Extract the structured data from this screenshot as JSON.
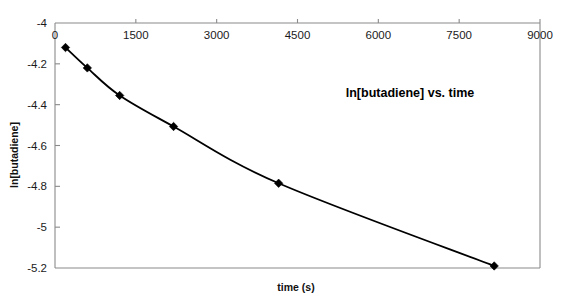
{
  "chart_data": {
    "type": "line",
    "title": "ln[butadiene] vs. time",
    "xlabel": "time (s)",
    "ylabel": "ln[butadiene]",
    "xlim": [
      0,
      9000
    ],
    "ylim": [
      -5.2,
      -4.0
    ],
    "grid": false,
    "legend": false,
    "legend_position": "none",
    "marker": "filled-diamond",
    "line_color": "#000000",
    "marker_color": "#000000",
    "frame_color": "#8a8a8a",
    "xticks": [
      0,
      1500,
      3000,
      4500,
      6000,
      7500,
      9000
    ],
    "xtick_labels": [
      "0",
      "1500",
      "3000",
      "4500",
      "6000",
      "7500",
      "9000"
    ],
    "yticks": [
      -4.0,
      -4.2,
      -4.4,
      -4.6,
      -4.8,
      -5.0,
      -5.2
    ],
    "ytick_labels": [
      "-4",
      "-4.2",
      "-4.4",
      "-4.6",
      "-4.8",
      "-5",
      "-5.2"
    ],
    "x": [
      195,
      600,
      1200,
      2200,
      4150,
      8150
    ],
    "y": [
      -4.12,
      -4.22,
      -4.355,
      -4.507,
      -4.785,
      -5.19
    ],
    "points": [
      {
        "x": 195,
        "y": -4.12
      },
      {
        "x": 600,
        "y": -4.22
      },
      {
        "x": 1200,
        "y": -4.355
      },
      {
        "x": 2200,
        "y": -4.507
      },
      {
        "x": 4150,
        "y": -4.785
      },
      {
        "x": 8150,
        "y": -5.19
      }
    ],
    "series": [
      {
        "name": "ln[butadiene]",
        "x": [
          195,
          600,
          1200,
          2200,
          4150,
          8150
        ],
        "values": [
          -4.12,
          -4.22,
          -4.355,
          -4.507,
          -4.785,
          -5.19
        ]
      }
    ]
  }
}
